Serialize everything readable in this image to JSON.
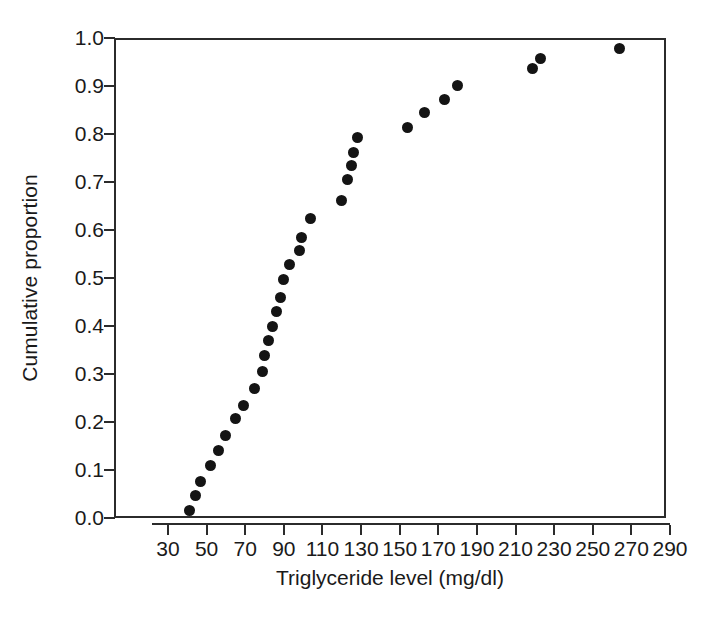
{
  "chart_data": {
    "type": "scatter",
    "title": "",
    "subtitle": "",
    "xlabel": "Triglyceride level (mg/dl)",
    "ylabel": "Cumulative proportion",
    "xlim": [
      30,
      290
    ],
    "ylim": [
      0.0,
      1.0
    ],
    "grid": false,
    "legend": null,
    "x_ticks": [
      30,
      50,
      70,
      90,
      110,
      130,
      150,
      170,
      190,
      210,
      230,
      250,
      270,
      290
    ],
    "x_tick_labels": [
      "30",
      "50",
      "70",
      "90",
      "110",
      "130",
      "150",
      "170",
      "190",
      "210",
      "230",
      "250",
      "270",
      "290"
    ],
    "y_ticks": [
      0.0,
      0.1,
      0.2,
      0.3,
      0.4,
      0.5,
      0.6,
      0.7,
      0.8,
      0.9,
      1.0
    ],
    "y_tick_labels": [
      "0.0",
      "0.1",
      "0.2",
      "0.3",
      "0.4",
      "0.5",
      "0.6",
      "0.7",
      "0.8",
      "0.9",
      "1.0"
    ],
    "marker": "filled-circle",
    "marker_color": "#141414",
    "marker_size_px": 11,
    "series": [
      {
        "name": "Cumulative distribution of triglyceride level",
        "points": [
          [
            40,
            0.019
          ],
          [
            43,
            0.051
          ],
          [
            46,
            0.08
          ],
          [
            51,
            0.113
          ],
          [
            55,
            0.145
          ],
          [
            59,
            0.177
          ],
          [
            64,
            0.212
          ],
          [
            68,
            0.238
          ],
          [
            74,
            0.274
          ],
          [
            78,
            0.309
          ],
          [
            79,
            0.343
          ],
          [
            81,
            0.375
          ],
          [
            83,
            0.404
          ],
          [
            85,
            0.434
          ],
          [
            87,
            0.463
          ],
          [
            89,
            0.502
          ],
          [
            92,
            0.533
          ],
          [
            97,
            0.561
          ],
          [
            98,
            0.589
          ],
          [
            103,
            0.629
          ],
          [
            119,
            0.666
          ],
          [
            122,
            0.709
          ],
          [
            124,
            0.738
          ],
          [
            125,
            0.765
          ],
          [
            127,
            0.796
          ],
          [
            153,
            0.818
          ],
          [
            162,
            0.849
          ],
          [
            172,
            0.877
          ],
          [
            179,
            0.905
          ],
          [
            218,
            0.94
          ],
          [
            222,
            0.962
          ],
          [
            263,
            0.982
          ]
        ]
      }
    ]
  },
  "axes": {
    "x_title": "Triglyceride level (mg/dl)",
    "y_title": "Cumulative proportion",
    "axis_color": "#2b2b2b"
  },
  "colors": {
    "background": "#ffffff",
    "marker": "#141414",
    "axis": "#2b2b2b",
    "text": "#1a1a1a"
  }
}
